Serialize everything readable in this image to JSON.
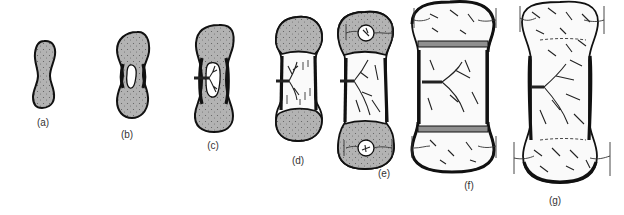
{
  "figure": {
    "fill_colors": {
      "cartilage": "#b3b3b3",
      "bone": "#fafafa",
      "outline": "#111111",
      "growth_plate": "#8f8f8f"
    },
    "stages": [
      {
        "id": "a",
        "label": "(a)",
        "content": "hyaline cartilage model"
      },
      {
        "id": "b",
        "label": "(b)",
        "content": "bone collar forms, cartilage in diaphysis calcifies and cavitates"
      },
      {
        "id": "c",
        "label": "(c)",
        "content": "periosteal bud / nutrient artery invades cavity"
      },
      {
        "id": "d",
        "label": "(d)",
        "content": "primary ossification center, spongy bone in diaphysis"
      },
      {
        "id": "e",
        "label": "(e)",
        "content": "secondary ossification centers appear in epiphyses"
      },
      {
        "id": "f",
        "label": "(f)",
        "content": "epiphyseal plates remain between epiphysis and diaphysis"
      },
      {
        "id": "g",
        "label": "(g)",
        "content": "adult bone, epiphyseal lines, articular cartilage only"
      }
    ]
  }
}
